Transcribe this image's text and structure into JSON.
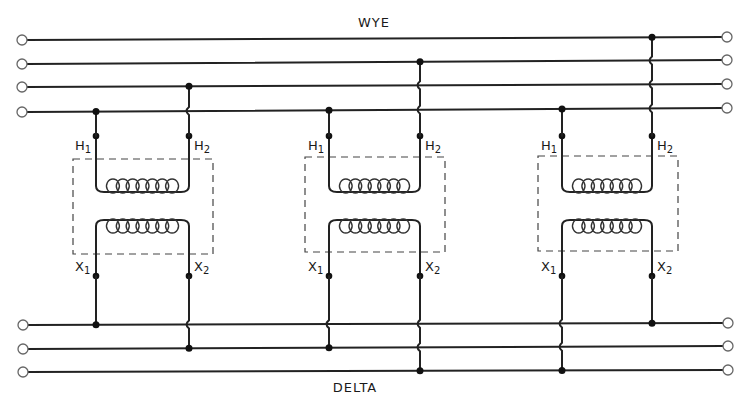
{
  "diagram": {
    "colors": {
      "wire": "#222222",
      "background": "#ffffff",
      "terminal_fill": "#ffffff",
      "junction": "#111111"
    },
    "wye": {
      "label": "WYE",
      "label_pos": {
        "x": 374,
        "y": 15
      },
      "lines": [
        {
          "id": "W1",
          "left": {
            "x": 22,
            "y": 40
          },
          "right": {
            "x": 727,
            "y": 37
          }
        },
        {
          "id": "W2",
          "left": {
            "x": 22,
            "y": 64
          },
          "right": {
            "x": 727,
            "y": 60
          }
        },
        {
          "id": "W3",
          "left": {
            "x": 22,
            "y": 87
          },
          "right": {
            "x": 727,
            "y": 84
          }
        },
        {
          "id": "W4",
          "left": {
            "x": 22,
            "y": 112
          },
          "right": {
            "x": 727,
            "y": 108
          }
        }
      ]
    },
    "delta": {
      "label": "DELTA",
      "label_pos": {
        "x": 355,
        "y": 380
      },
      "lines": [
        {
          "id": "D1",
          "left": {
            "x": 23,
            "y": 325
          },
          "right": {
            "x": 728,
            "y": 323
          }
        },
        {
          "id": "D2",
          "left": {
            "x": 23,
            "y": 349
          },
          "right": {
            "x": 728,
            "y": 346
          }
        },
        {
          "id": "D3",
          "left": {
            "x": 23,
            "y": 372
          },
          "right": {
            "x": 728,
            "y": 370
          }
        }
      ]
    },
    "transformers": [
      {
        "id": "T1",
        "left_x": 96,
        "right_x": 189,
        "box": {
          "x": 73,
          "y": 159,
          "w": 140,
          "h": 95
        },
        "primary": {
          "h1_label": "H",
          "h1_sub": "1",
          "h2_label": "H",
          "h2_sub": "2",
          "h1_connects": "W4",
          "h2_connects": "W3"
        },
        "secondary": {
          "x1_label": "X",
          "x1_sub": "1",
          "x2_label": "X",
          "x2_sub": "2",
          "x1_connects": "D1",
          "x2_connects": "D2"
        },
        "turns": 7
      },
      {
        "id": "T2",
        "left_x": 329,
        "right_x": 420,
        "box": {
          "x": 305,
          "y": 157,
          "w": 140,
          "h": 95
        },
        "primary": {
          "h1_label": "H",
          "h1_sub": "1",
          "h2_label": "H",
          "h2_sub": "2",
          "h1_connects": "W4",
          "h2_connects": "W2"
        },
        "secondary": {
          "x1_label": "X",
          "x1_sub": "1",
          "x2_label": "X",
          "x2_sub": "2",
          "x1_connects": "D2",
          "x2_connects": "D3"
        },
        "turns": 7
      },
      {
        "id": "T3",
        "left_x": 562,
        "right_x": 652,
        "box": {
          "x": 538,
          "y": 156,
          "w": 140,
          "h": 95
        },
        "primary": {
          "h1_label": "H",
          "h1_sub": "1",
          "h2_label": "H",
          "h2_sub": "2",
          "h1_connects": "W4",
          "h2_connects": "W1"
        },
        "secondary": {
          "x1_label": "X",
          "x1_sub": "1",
          "x2_label": "X",
          "x2_sub": "2",
          "x1_connects": "D3",
          "x2_connects": "D1"
        },
        "turns": 7
      }
    ]
  }
}
